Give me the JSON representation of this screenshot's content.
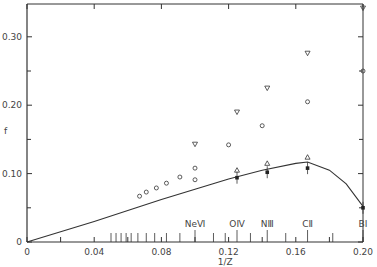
{
  "chart_data": {
    "type": "scatter",
    "title": "",
    "xlabel": "1/Z",
    "ylabel": "f",
    "xlim": [
      0,
      0.2
    ],
    "ylim": [
      0,
      0.35
    ],
    "x_ticks": [
      "0",
      "0.04",
      "0.08",
      "0.12",
      "0.16",
      "0.20"
    ],
    "y_ticks": [
      "0",
      "0.10",
      "0.20",
      "0.30"
    ],
    "grid": false,
    "ion_labels": [
      {
        "label": "NeⅥ",
        "x": 0.1
      },
      {
        "label": "OⅣ",
        "x": 0.125
      },
      {
        "label": "NⅢ",
        "x": 0.143
      },
      {
        "label": "CⅡ",
        "x": 0.167
      },
      {
        "label": "BⅠ",
        "x": 0.2
      }
    ],
    "series": [
      {
        "name": "theory curve",
        "marker": "line",
        "x": [
          0,
          0.04,
          0.08,
          0.1,
          0.12,
          0.14,
          0.16,
          0.167,
          0.18,
          0.19,
          0.2
        ],
        "y": [
          0,
          0.03,
          0.062,
          0.077,
          0.092,
          0.105,
          0.115,
          0.117,
          0.105,
          0.085,
          0.052
        ]
      },
      {
        "name": "open circles",
        "marker": "circle",
        "x": [
          0.067,
          0.071,
          0.077,
          0.083,
          0.091,
          0.1,
          0.1,
          0.12,
          0.14,
          0.167,
          0.2
        ],
        "y": [
          0.067,
          0.073,
          0.079,
          0.086,
          0.095,
          0.108,
          0.091,
          0.142,
          0.17,
          0.205,
          0.25
        ]
      },
      {
        "name": "open triangles down",
        "marker": "triangle-down",
        "x": [
          0.1,
          0.125,
          0.143,
          0.167,
          0.2
        ],
        "y": [
          0.143,
          0.19,
          0.225,
          0.276,
          0.342
        ]
      },
      {
        "name": "open triangles up",
        "marker": "triangle-up",
        "x": [
          0.125,
          0.143,
          0.167
        ],
        "y": [
          0.105,
          0.115,
          0.124
        ]
      },
      {
        "name": "filled points (experiment)",
        "marker": "filled-square",
        "x": [
          0.125,
          0.143,
          0.167,
          0.2
        ],
        "y": [
          0.094,
          0.102,
          0.108,
          0.05
        ]
      }
    ],
    "minor_ticks_x": [
      0.05,
      0.053,
      0.056,
      0.059,
      0.062,
      0.066,
      0.071,
      0.076,
      0.083,
      0.091,
      0.111,
      0.118,
      0.133,
      0.154,
      0.182
    ]
  }
}
